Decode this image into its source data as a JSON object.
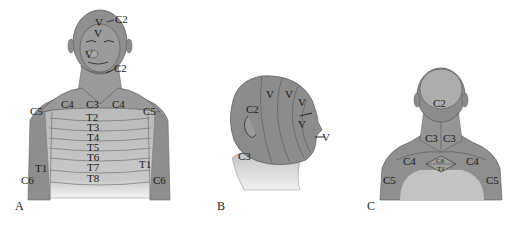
{
  "figure": {
    "panels": [
      {
        "id": "A",
        "label": "A",
        "view": "anterior upper body",
        "labels": {
          "head_top": "C2",
          "v1": "V",
          "v2": "V",
          "v3": "V",
          "jaw": "C2",
          "c4_left": "C4",
          "c3": "C3",
          "c4_right": "C4",
          "c5_left": "C5",
          "c5_right": "C5",
          "t2": "T2",
          "t3": "T3",
          "t4": "T4",
          "t5": "T5",
          "t6": "T6",
          "t7": "T7",
          "t8": "T8",
          "t1_left": "T1",
          "t1_right": "T1",
          "c6_left": "C6",
          "c6_right": "C6"
        }
      },
      {
        "id": "B",
        "label": "B",
        "view": "lateral head",
        "labels": {
          "v_a": "V",
          "v_b": "V",
          "v_c": "V",
          "v_d": "V",
          "v_mouth": "V",
          "c2": "C2",
          "c3": "C3"
        }
      },
      {
        "id": "C",
        "label": "C",
        "view": "posterior neck and shoulders",
        "labels": {
          "c2": "C2",
          "c3_left": "C3",
          "c3_right": "C3",
          "c4_left": "C4",
          "c4_right": "C4",
          "c6": "C6",
          "t1": "T1",
          "c5_left": "C5",
          "c5_right": "C5"
        }
      }
    ],
    "colors": {
      "dark_region": "#8a8a8a",
      "mid_region": "#a3a3a3",
      "light_region": "#c4c4c4",
      "lines": "#555555",
      "text": "#1a1a1a"
    }
  }
}
